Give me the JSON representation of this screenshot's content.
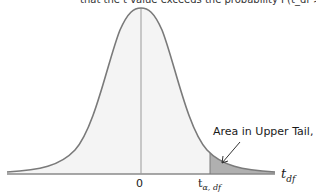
{
  "figure": {
    "clipped_header": "that the t value exceeds the probability P(t_df > t_α,df) = α",
    "annotation": {
      "text": "Area in Upper Tail, ",
      "symbol": "α"
    },
    "axis": {
      "center_label": "0",
      "critical_label_main": "t",
      "critical_label_sub": "α, df",
      "variable_label_main": "t",
      "variable_label_sub": "df"
    },
    "colors": {
      "curve": "#7a7a7a",
      "body_fill": "#f4f4f4",
      "tail_fill": "#b0b0b0",
      "axis": "#8a8a8a"
    }
  }
}
